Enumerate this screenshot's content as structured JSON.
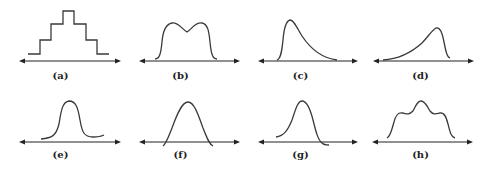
{
  "figure": {
    "panels": [
      {
        "id": "a",
        "label": "(a)",
        "shape": "stepped-symmetric"
      },
      {
        "id": "b",
        "label": "(b)",
        "shape": "bimodal-flat-top"
      },
      {
        "id": "c",
        "label": "(c)",
        "shape": "right-skewed"
      },
      {
        "id": "d",
        "label": "(d)",
        "shape": "left-skewed"
      },
      {
        "id": "e",
        "label": "(e)",
        "shape": "plateau"
      },
      {
        "id": "f",
        "label": "(f)",
        "shape": "bell-crossing-axis"
      },
      {
        "id": "g",
        "label": "(g)",
        "shape": "slightly-left-skewed-crossing-axis"
      },
      {
        "id": "h",
        "label": "(h)",
        "shape": "trimodal"
      }
    ],
    "line_color": "#3a3a3a",
    "axis_color": "#222222"
  }
}
